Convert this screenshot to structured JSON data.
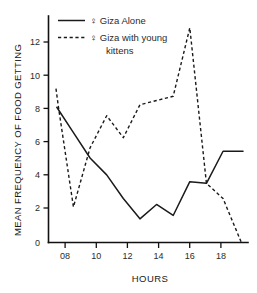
{
  "chart_data": {
    "type": "line",
    "title": "",
    "xlabel": "HOURS",
    "ylabel": "MEAN FREQUENCY OF FOOD GETTING",
    "xlim": [
      7.0,
      19.0
    ],
    "ylim": [
      0,
      13.4
    ],
    "grid": false,
    "legend_position": "top-center",
    "xticks": [
      8,
      10,
      12,
      14,
      16,
      18
    ],
    "xtick_labels": [
      "08",
      "10",
      "12",
      "14",
      "16",
      "18"
    ],
    "yticks": [
      0,
      2,
      4,
      6,
      8,
      10,
      12
    ],
    "ytick_labels": [
      "0",
      "2",
      "4",
      "6",
      "8",
      "10",
      "12"
    ],
    "series": [
      {
        "name": "♀ Giza Alone",
        "style": "solid",
        "x": [
          7.5,
          8.5,
          9.5,
          10.5,
          11.5,
          12.5,
          13.5,
          14.5,
          15.5,
          16.5,
          17.5,
          18.7
        ],
        "values": [
          8.0,
          6.5,
          5.0,
          4.0,
          2.6,
          1.4,
          2.25,
          1.6,
          3.6,
          3.5,
          5.4,
          5.4
        ]
      },
      {
        "name": "♀ Giza with young kittens",
        "style": "dashed",
        "x": [
          7.45,
          7.6,
          8.5,
          9.5,
          10.5,
          11.5,
          12.5,
          13.5,
          14.5,
          15.5,
          16.5,
          17.5,
          18.6
        ],
        "values": [
          9.1,
          8.0,
          2.1,
          5.6,
          7.5,
          6.2,
          8.15,
          8.4,
          8.65,
          12.7,
          3.5,
          2.6,
          0.0
        ]
      }
    ]
  },
  "legend": {
    "entries": [
      {
        "label": "♀ Giza Alone",
        "label2": "",
        "style": "solid"
      },
      {
        "label": "♀ Giza with young",
        "label2": "kittens",
        "style": "dashed"
      }
    ]
  },
  "axis": {
    "x_title": "HOURS",
    "y_title": "MEAN FREQUENCY OF FOOD GETTING"
  }
}
